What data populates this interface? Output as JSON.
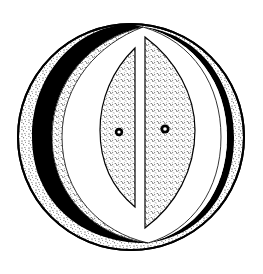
{
  "figure": {
    "title": "",
    "background": "#ffffff",
    "ink_color": "#000000",
    "stipple_color": "#1a1a1a",
    "parts": {
      "outer_ring": {
        "label": "",
        "fill": "stippled"
      },
      "left_crescent": {
        "label": "",
        "fill": "solid-black"
      },
      "right_band": {
        "label": "",
        "fill": "solid-black"
      },
      "inner_lens": {
        "label": "",
        "fill": "white"
      },
      "left_half": {
        "label": "",
        "fill": "stippled",
        "dot": "left-nucleus"
      },
      "right_half": {
        "label": "",
        "fill": "stippled",
        "dot": "right-nucleus"
      }
    }
  }
}
